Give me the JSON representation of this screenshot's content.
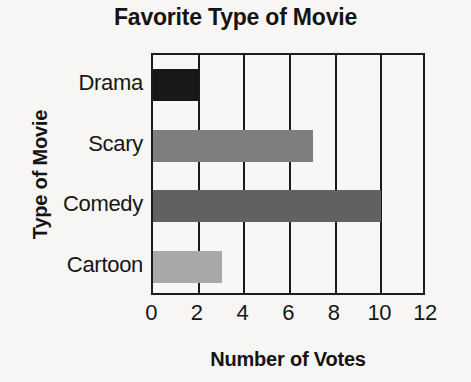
{
  "chart_data": {
    "type": "bar",
    "orientation": "horizontal",
    "title": "Favorite Type of Movie",
    "xlabel": "Number of Votes",
    "ylabel": "Type of Movie",
    "categories": [
      "Drama",
      "Scary",
      "Comedy",
      "Cartoon"
    ],
    "values": [
      2,
      7,
      10,
      3
    ],
    "bar_colors": [
      "#181818",
      "#7e7e7e",
      "#616161",
      "#a9a9a9"
    ],
    "xlim": [
      0,
      12
    ],
    "xticks": [
      0,
      2,
      4,
      6,
      8,
      10,
      12
    ],
    "xtick_labels": [
      "0",
      "2",
      "4",
      "6",
      "8",
      "10",
      "12"
    ],
    "grid": "vertical",
    "gridline_values": [
      2,
      4,
      6,
      8,
      10
    ],
    "legend": "none",
    "axis_color": "#1b1b1b",
    "background_color": "#f7f6f4",
    "bars": [
      {
        "category": "Drama",
        "value": 2,
        "color": "#181818"
      },
      {
        "category": "Scary",
        "value": 7,
        "color": "#7e7e7e"
      },
      {
        "category": "Comedy",
        "value": 10,
        "color": "#616161"
      },
      {
        "category": "Cartoon",
        "value": 3,
        "color": "#a9a9a9"
      }
    ]
  }
}
